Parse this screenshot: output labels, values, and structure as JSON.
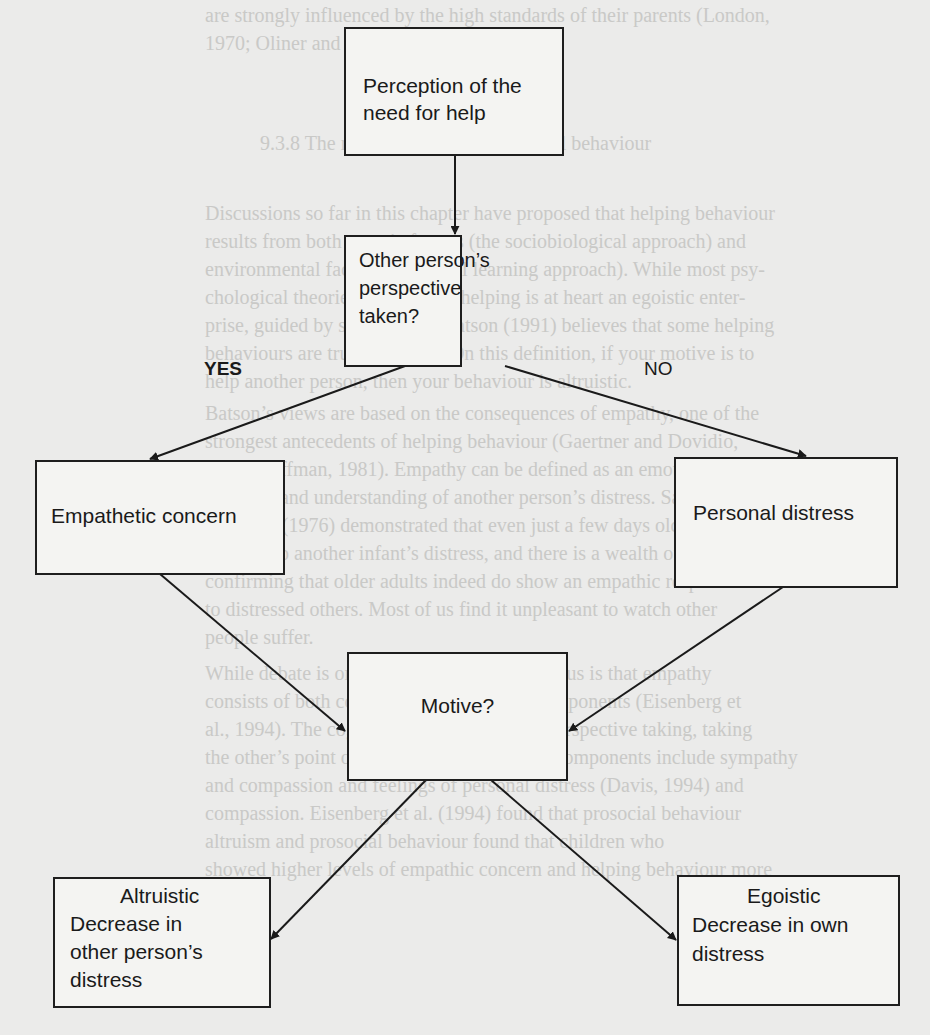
{
  "diagram": {
    "nodes": {
      "perception": {
        "lines": [
          "Perception of the",
          "need for help"
        ]
      },
      "perspective": {
        "lines": [
          "Other person’s",
          "perspective",
          "taken?"
        ]
      },
      "empathetic": {
        "lines": [
          "Empathetic concern"
        ]
      },
      "personal": {
        "lines": [
          "Personal distress"
        ]
      },
      "motive": {
        "lines": [
          "Motive?"
        ]
      },
      "altruistic": {
        "heading": "Altruistic",
        "lines": [
          "Decrease in",
          "other person’s",
          "distress"
        ]
      },
      "egoistic": {
        "heading": "Egoistic",
        "lines": [
          "Decrease in own",
          "distress"
        ]
      }
    },
    "edges": [
      {
        "from": "perception",
        "to": "perspective",
        "label": ""
      },
      {
        "from": "perspective",
        "to": "empathetic",
        "label": "YES"
      },
      {
        "from": "perspective",
        "to": "personal",
        "label": "NO"
      },
      {
        "from": "empathetic",
        "to": "motive",
        "label": ""
      },
      {
        "from": "personal",
        "to": "motive",
        "label": ""
      },
      {
        "from": "motive",
        "to": "altruistic",
        "label": ""
      },
      {
        "from": "motive",
        "to": "egoistic",
        "label": ""
      }
    ],
    "edge_labels": {
      "yes": "YES",
      "no": "NO"
    }
  },
  "background_text": {
    "lines": [
      "are strongly influenced by the high standards of their parents (London,",
      "1970; Oliner and Oliner, 1988).",
      "9.3.8 The role of empathy in prosocial behaviour",
      "Discussions so far in this chapter have proposed that helping behaviour",
      "results from both genetic factors (the sociobiological approach) and",
      "environmental factors (the social learning approach). While most psy-",
      "chological theories assume that helping is at heart an egoistic enter-",
      "prise, guided by self-interest, Batson (1991) believes that some helping",
      "behaviours are truly altruistic. On this definition, if your motive is to",
      "help another person, then your behaviour is altruistic.",
      "Batson’s views are based on the consequences of empathy, one of the",
      "strongest antecedents of helping behaviour (Gaertner and Dovidio,",
      "1977; Hoffman, 1981). Empathy can be defined as an emotional",
      "response and understanding of another person’s distress. Sagi and",
      "Hoffman (1976) demonstrated that even just a few days old infants",
      "respond to another infant’s distress, and there is a wealth of research",
      "confirming that older adults indeed do show an empathic response",
      "to distressed others. Most of us find it unpleasant to watch other",
      "people suffer.",
      "While debate is ongoing, the general consensus is that empathy",
      "consists of both cognitive and emotional components (Eisenberg et",
      "al., 1994). The cognitive elements include perspective taking, taking",
      "the other’s point of view and the emotional components include sympathy",
      "and compassion and feelings of personal distress (Davis, 1994) and",
      "compassion. Eisenberg et al. (1994) found that prosocial behaviour",
      "altruism and prosocial behaviour found that children who",
      "showed higher levels of empathic concern and helping behaviour more"
    ]
  }
}
